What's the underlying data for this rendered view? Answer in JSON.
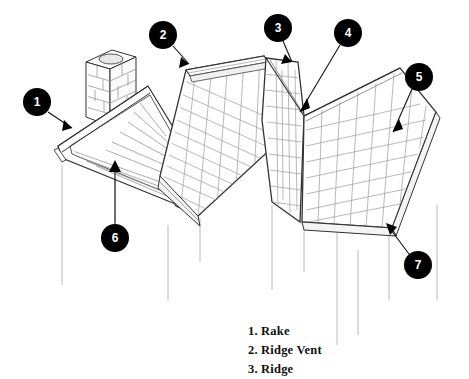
{
  "diagram": {
    "type": "technical-line-drawing",
    "background_color": "#ffffff",
    "line_color": "#222222",
    "light_line_color": "#9a9a9a",
    "callout_fill": "#000000",
    "callout_text_color": "#ffffff",
    "callouts": [
      {
        "number": "1",
        "cx": 37,
        "cy": 102,
        "r": 14,
        "tip_x": 72,
        "tip_y": 128,
        "target": "rake-edge"
      },
      {
        "number": "2",
        "cx": 163,
        "cy": 35,
        "r": 14,
        "tip_x": 189,
        "tip_y": 64,
        "target": "ridge-vent"
      },
      {
        "number": "3",
        "cx": 278,
        "cy": 28,
        "r": 14,
        "tip_x": 292,
        "tip_y": 62,
        "target": "ridge"
      },
      {
        "number": "4",
        "cx": 348,
        "cy": 33,
        "r": 14,
        "tip_x": 300,
        "tip_y": 112,
        "target": "hip"
      },
      {
        "number": "5",
        "cx": 419,
        "cy": 77,
        "r": 14,
        "tip_x": 393,
        "tip_y": 132,
        "target": "shingle-field"
      },
      {
        "number": "6",
        "cx": 115,
        "cy": 238,
        "r": 14,
        "tip_x": 115,
        "tip_y": 163,
        "target": "gable-end"
      },
      {
        "number": "7",
        "cx": 418,
        "cy": 265,
        "r": 14,
        "tip_x": 388,
        "tip_y": 226,
        "target": "eave"
      }
    ],
    "legend": {
      "items": [
        "1. Rake",
        "2. Ridge Vent",
        "3. Ridge"
      ]
    },
    "features": {
      "chimney_label": "chimney",
      "gable_label": "gable-end-siding",
      "main_slope_label": "shingled-roof-slope",
      "hip_slope_label": "hip-roof-slope",
      "wall_lines_label": "wall-edge-guides"
    }
  }
}
